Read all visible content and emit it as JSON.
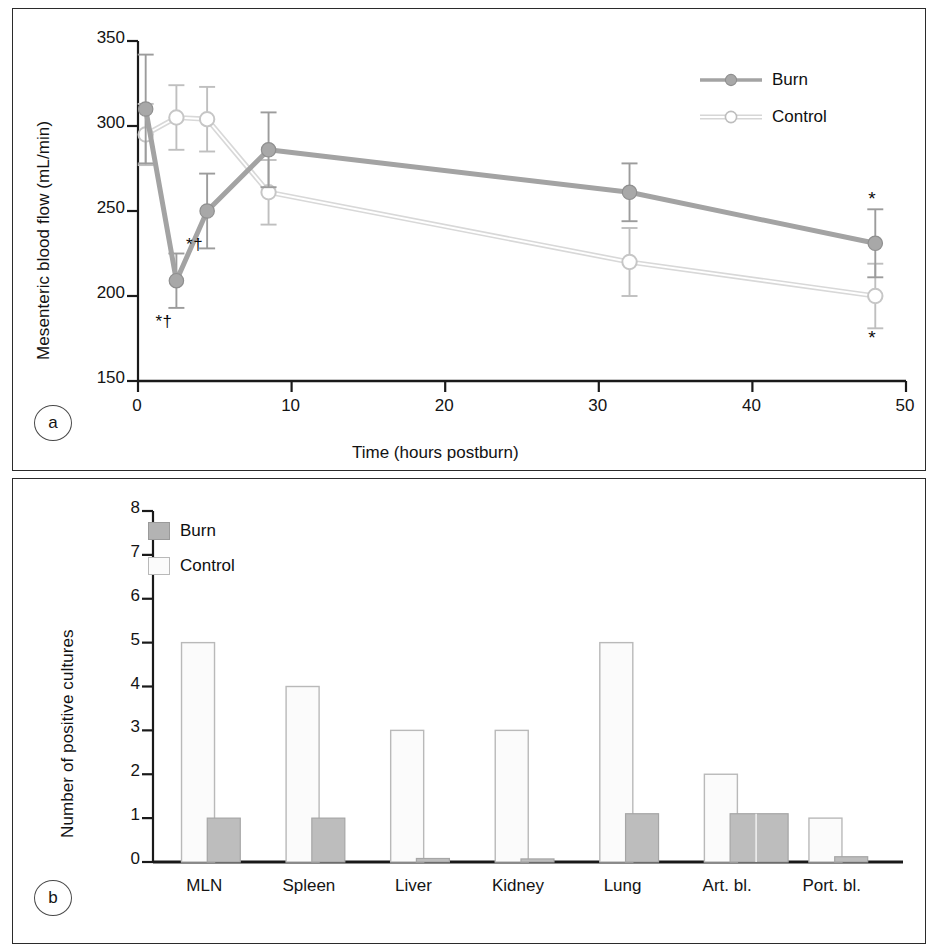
{
  "figure": {
    "panel_a_letter": "a",
    "panel_b_letter": "b"
  },
  "chart_data": [
    {
      "type": "line",
      "panel": "a",
      "title": "",
      "xlabel": "Time (hours postburn)",
      "ylabel": "Mesenteric blood flow (mL/min)",
      "xlim": [
        0,
        50
      ],
      "ylim": [
        150,
        350
      ],
      "xticks": [
        0,
        10,
        20,
        30,
        40,
        50
      ],
      "xtick_labels": [
        "0",
        "10",
        "20",
        "30",
        "40",
        "50"
      ],
      "yticks": [
        150,
        200,
        250,
        300,
        350
      ],
      "ytick_labels": [
        "150",
        "200",
        "250",
        "300",
        "350"
      ],
      "grid": false,
      "legend_position": "top-right",
      "x": [
        0.5,
        2.5,
        4.5,
        8.5,
        32,
        48
      ],
      "series": [
        {
          "name": "Burn",
          "marker": "filled-circle",
          "color": "#a3a3a3",
          "values": [
            310,
            209,
            250,
            286,
            261,
            231
          ],
          "errors": [
            32,
            16,
            22,
            22,
            17,
            20
          ]
        },
        {
          "name": "Control",
          "marker": "open-circle",
          "color": "#d6d6d6",
          "values": [
            295,
            305,
            304,
            261,
            220,
            200
          ],
          "errors": [
            18,
            19,
            19,
            19,
            20,
            19
          ]
        }
      ],
      "annotations": [
        {
          "text": "*†",
          "x": 2.5,
          "y": 183,
          "note": "burn 2.5 h significance"
        },
        {
          "text": "*†",
          "x": 4.5,
          "y": 228,
          "note": "burn 4.5 h significance"
        },
        {
          "text": "*",
          "x": 48,
          "y": 256,
          "note": "burn 48 h significance"
        },
        {
          "text": "*",
          "x": 48,
          "y": 174,
          "note": "control 48 h significance"
        }
      ]
    },
    {
      "type": "bar",
      "panel": "b",
      "title": "",
      "xlabel": "",
      "ylabel": "Number of positive cultures",
      "ylim": [
        0,
        8
      ],
      "yticks": [
        0,
        1,
        2,
        3,
        4,
        5,
        6,
        7,
        8
      ],
      "ytick_labels": [
        "0",
        "1",
        "2",
        "3",
        "4",
        "5",
        "6",
        "7",
        "8"
      ],
      "grid": false,
      "legend_position": "top-left",
      "categories": [
        "MLN",
        "Spleen",
        "Liver",
        "Kidney",
        "Lung",
        "Art. bl.",
        "Port. bl."
      ],
      "series": [
        {
          "name": "Control",
          "color": "#fbfbfb",
          "edge": "#b9b9b9",
          "values": [
            5,
            4,
            3,
            3,
            5,
            2,
            1
          ]
        },
        {
          "name": "Burn",
          "color": "#bdbdbd",
          "edge": "#a6a6a6",
          "values": [
            1,
            1,
            0.08,
            0.07,
            1.1,
            1.1,
            0.12
          ]
        }
      ]
    }
  ],
  "panel_a": {
    "ylabel": "Mesenteric blood flow (mL/min)",
    "xlabel": "Time (hours postburn)",
    "legend": [
      {
        "label": "Burn",
        "marker": "filled-circle"
      },
      {
        "label": "Control",
        "marker": "open-circle"
      }
    ],
    "yticks": [
      "350",
      "300",
      "250",
      "200",
      "150"
    ],
    "xticks": [
      "0",
      "10",
      "20",
      "30",
      "40",
      "50"
    ],
    "annotations": [
      "*†",
      "*†",
      "*",
      "*"
    ]
  },
  "panel_b": {
    "ylabel": "Number of positive cultures",
    "legend": [
      {
        "label": "Burn",
        "swatch": "filled-square"
      },
      {
        "label": "Control",
        "swatch": "open-square"
      }
    ],
    "yticks": [
      "8",
      "7",
      "6",
      "5",
      "4",
      "3",
      "2",
      "1",
      "0"
    ],
    "categories": [
      "MLN",
      "Spleen",
      "Liver",
      "Kidney",
      "Lung",
      "Art. bl.",
      "Port. bl."
    ]
  },
  "colors": {
    "burn_line": "#a3a3a3",
    "control_line": "#d6d6d6",
    "burn_fill": "#bdbdbd",
    "control_fill": "#fbfbfb",
    "axis": "#1a1a1a",
    "frame": "#2b2b2b"
  }
}
